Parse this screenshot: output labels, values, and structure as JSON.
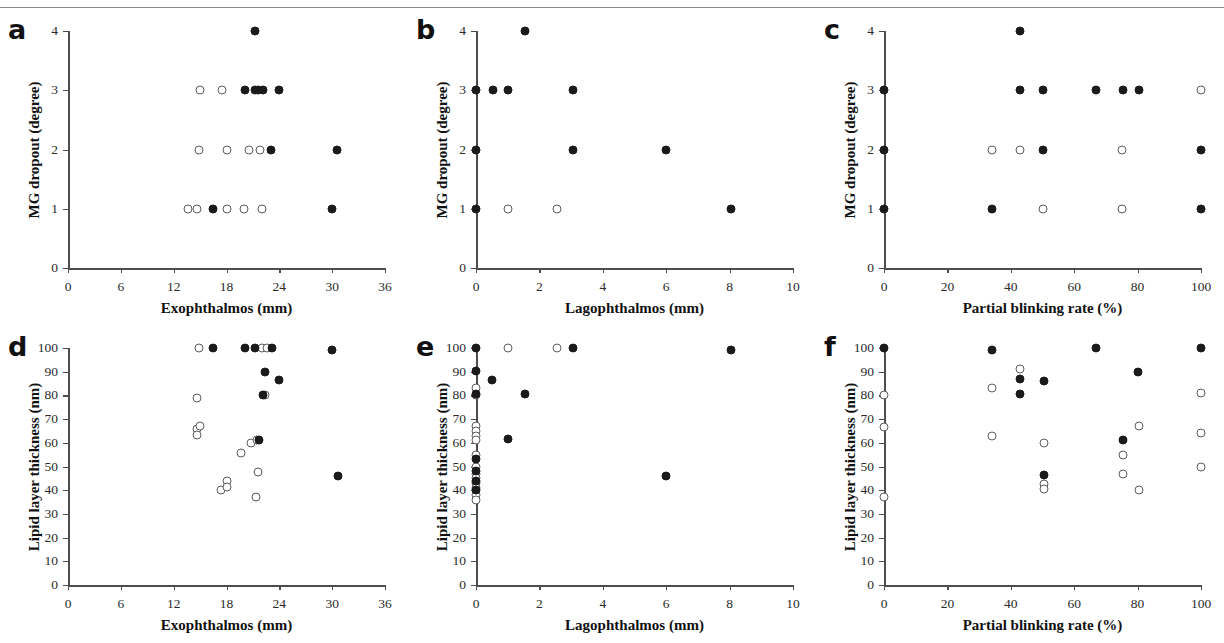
{
  "figure": {
    "panel_letters": [
      "a",
      "b",
      "c",
      "d",
      "e",
      "f"
    ]
  },
  "chart_data": [
    {
      "panel": "a",
      "type": "scatter",
      "title": "",
      "xlabel": "Exophthalmos (mm)",
      "ylabel": "MG dropout (degree)",
      "xlim": [
        0,
        36
      ],
      "ylim": [
        0,
        4
      ],
      "xticks": [
        0,
        6,
        12,
        18,
        24,
        30,
        36
      ],
      "yticks": [
        0,
        1,
        2,
        3,
        4
      ],
      "grid": false,
      "legend": "none",
      "series": [
        {
          "name": "open",
          "marker": "open-circle",
          "points": [
            [
              15.0,
              3
            ],
            [
              17.5,
              3
            ],
            [
              14.9,
              2
            ],
            [
              18.0,
              2
            ],
            [
              20.6,
              2
            ],
            [
              21.8,
              2
            ],
            [
              13.6,
              1
            ],
            [
              14.6,
              1
            ],
            [
              18.0,
              1
            ],
            [
              20.0,
              1
            ],
            [
              22.0,
              1
            ]
          ]
        },
        {
          "name": "filled",
          "marker": "filled-circle",
          "points": [
            [
              21.2,
              4
            ],
            [
              20.1,
              3
            ],
            [
              21.2,
              3
            ],
            [
              21.6,
              3
            ],
            [
              22.1,
              3
            ],
            [
              24.0,
              3
            ],
            [
              23.0,
              2
            ],
            [
              30.6,
              2
            ],
            [
              16.5,
              1
            ],
            [
              30.0,
              1
            ]
          ]
        }
      ]
    },
    {
      "panel": "b",
      "type": "scatter",
      "title": "",
      "xlabel": "Lagophthalmos (mm)",
      "ylabel": "MG dropout (degree)",
      "xlim": [
        0,
        10
      ],
      "ylim": [
        0,
        4
      ],
      "xticks": [
        0,
        2,
        4,
        6,
        8,
        10
      ],
      "yticks": [
        0,
        1,
        2,
        3,
        4
      ],
      "grid": false,
      "legend": "none",
      "series": [
        {
          "name": "open",
          "marker": "open-circle",
          "points": [
            [
              1.0,
              1
            ],
            [
              2.55,
              1
            ]
          ]
        },
        {
          "name": "filled",
          "marker": "filled-circle",
          "points": [
            [
              1.55,
              4
            ],
            [
              0.0,
              3
            ],
            [
              0.55,
              3
            ],
            [
              1.0,
              3
            ],
            [
              3.05,
              3
            ],
            [
              0.0,
              2
            ],
            [
              3.05,
              2
            ],
            [
              6.0,
              2
            ],
            [
              0.0,
              1
            ],
            [
              8.05,
              1
            ]
          ]
        }
      ]
    },
    {
      "panel": "c",
      "type": "scatter",
      "title": "",
      "xlabel": "Partial blinking rate (%)",
      "ylabel": "MG dropout (degree)",
      "xlim": [
        0,
        100
      ],
      "ylim": [
        0,
        4
      ],
      "xticks": [
        0,
        20,
        40,
        60,
        80,
        100
      ],
      "yticks": [
        0,
        1,
        2,
        3,
        4
      ],
      "grid": false,
      "legend": "none",
      "series": [
        {
          "name": "open",
          "marker": "open-circle",
          "points": [
            [
              100,
              3
            ],
            [
              34,
              2
            ],
            [
              43,
              2
            ],
            [
              75,
              2
            ],
            [
              50,
              1
            ],
            [
              75,
              1
            ]
          ]
        },
        {
          "name": "filled",
          "marker": "filled-circle",
          "points": [
            [
              43,
              4
            ],
            [
              0,
              3
            ],
            [
              43,
              3
            ],
            [
              50,
              3
            ],
            [
              67,
              3
            ],
            [
              75.5,
              3
            ],
            [
              80.5,
              3
            ],
            [
              0,
              2
            ],
            [
              50,
              2
            ],
            [
              100,
              2
            ],
            [
              0,
              1
            ],
            [
              34,
              1
            ],
            [
              100,
              1
            ]
          ]
        }
      ]
    },
    {
      "panel": "d",
      "type": "scatter",
      "title": "",
      "xlabel": "Exophthalmos (mm)",
      "ylabel": "Lipid layer thickness (nm)",
      "xlim": [
        0,
        36
      ],
      "ylim": [
        0,
        100
      ],
      "xticks": [
        0,
        6,
        12,
        18,
        24,
        30,
        36
      ],
      "yticks": [
        0,
        10,
        20,
        30,
        40,
        50,
        60,
        70,
        80,
        90,
        100
      ],
      "grid": false,
      "legend": "none",
      "series": [
        {
          "name": "open",
          "marker": "open-circle",
          "points": [
            [
              14.9,
              100
            ],
            [
              22.0,
              100
            ],
            [
              22.6,
              100
            ],
            [
              22.4,
              80
            ],
            [
              14.6,
              79
            ],
            [
              14.7,
              66
            ],
            [
              15.0,
              67
            ],
            [
              14.6,
              63.5
            ],
            [
              20.8,
              60
            ],
            [
              21.5,
              61
            ],
            [
              19.6,
              55.5
            ],
            [
              21.6,
              47.5
            ],
            [
              18.0,
              44
            ],
            [
              17.4,
              40
            ],
            [
              18.0,
              41.5
            ],
            [
              21.4,
              37
            ]
          ]
        },
        {
          "name": "filled",
          "marker": "filled-circle",
          "points": [
            [
              16.5,
              100
            ],
            [
              20.1,
              100
            ],
            [
              21.2,
              100
            ],
            [
              23.2,
              100
            ],
            [
              30.0,
              99
            ],
            [
              22.4,
              90
            ],
            [
              24.0,
              86.5
            ],
            [
              22.1,
              80
            ],
            [
              21.7,
              61
            ],
            [
              30.7,
              46
            ]
          ]
        }
      ]
    },
    {
      "panel": "e",
      "type": "scatter",
      "title": "",
      "xlabel": "Lagophthalmos (mm)",
      "ylabel": "Lipid layer thickness (nm)",
      "xlim": [
        0,
        10
      ],
      "ylim": [
        0,
        100
      ],
      "xticks": [
        0,
        2,
        4,
        6,
        8,
        10
      ],
      "yticks": [
        0,
        10,
        20,
        30,
        40,
        50,
        60,
        70,
        80,
        90,
        100
      ],
      "grid": false,
      "legend": "none",
      "series": [
        {
          "name": "open",
          "marker": "open-circle",
          "points": [
            [
              1.0,
              100
            ],
            [
              2.55,
              100
            ],
            [
              0.0,
              83
            ],
            [
              0.0,
              80
            ],
            [
              0.0,
              67
            ],
            [
              0.0,
              65
            ],
            [
              0.0,
              63
            ],
            [
              0.0,
              61
            ],
            [
              0.0,
              55
            ],
            [
              0.0,
              50
            ],
            [
              0.0,
              47
            ],
            [
              0.0,
              45
            ],
            [
              0.0,
              43
            ],
            [
              0.0,
              41
            ],
            [
              0.0,
              38
            ],
            [
              0.0,
              36
            ]
          ]
        },
        {
          "name": "filled",
          "marker": "filled-circle",
          "points": [
            [
              0.0,
              100
            ],
            [
              3.05,
              100
            ],
            [
              8.05,
              99
            ],
            [
              0.0,
              90.5
            ],
            [
              0.5,
              86.5
            ],
            [
              0.0,
              80.5
            ],
            [
              1.55,
              80.5
            ],
            [
              1.0,
              61.5
            ],
            [
              0.0,
              53
            ],
            [
              0.0,
              48
            ],
            [
              0.0,
              44
            ],
            [
              0.0,
              40
            ],
            [
              6.0,
              46
            ]
          ]
        }
      ]
    },
    {
      "panel": "f",
      "type": "scatter",
      "title": "",
      "xlabel": "Partial blinking rate (%)",
      "ylabel": "Lipid layer thickness (nm)",
      "xlim": [
        0,
        100
      ],
      "ylim": [
        0,
        100
      ],
      "xticks": [
        0,
        20,
        40,
        60,
        80,
        100
      ],
      "yticks": [
        0,
        10,
        20,
        30,
        40,
        50,
        60,
        70,
        80,
        90,
        100
      ],
      "grid": false,
      "legend": "none",
      "series": [
        {
          "name": "open",
          "marker": "open-circle",
          "points": [
            [
              43,
              91
            ],
            [
              34,
              83
            ],
            [
              0,
              80
            ],
            [
              100,
              81
            ],
            [
              0,
              66.5
            ],
            [
              80.5,
              67
            ],
            [
              100,
              64
            ],
            [
              34,
              63
            ],
            [
              50.5,
              60
            ],
            [
              75.5,
              55
            ],
            [
              100,
              50
            ],
            [
              75.5,
              47
            ],
            [
              50.5,
              42.5
            ],
            [
              50.5,
              40.5
            ],
            [
              80.5,
              40
            ],
            [
              0,
              37
            ]
          ]
        },
        {
          "name": "filled",
          "marker": "filled-circle",
          "points": [
            [
              0,
              100
            ],
            [
              67,
              100
            ],
            [
              100,
              100
            ],
            [
              34,
              99
            ],
            [
              80,
              90
            ],
            [
              43,
              87
            ],
            [
              50.5,
              86
            ],
            [
              43,
              80.5
            ],
            [
              75.5,
              61
            ],
            [
              50.5,
              46.5
            ]
          ]
        }
      ]
    }
  ]
}
